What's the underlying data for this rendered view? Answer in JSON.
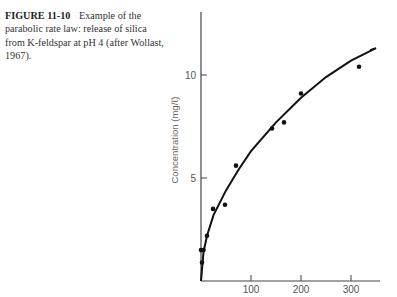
{
  "caption": {
    "figure_label": "FIGURE 11-10",
    "text": "Example of the parabolic rate law: release of silica from K-feldspar at pH 4 (after Wollast, 1967)."
  },
  "chart_data": {
    "type": "scatter",
    "title": "Example of the parabolic rate law: release of silica from K-feldspar at pH 4 (after Wollast, 1967).",
    "xlabel": "",
    "ylabel": "Concentration (mg/ℓ)",
    "xlim": [
      0,
      360
    ],
    "ylim": [
      0,
      13
    ],
    "xticks": [
      100,
      200,
      300
    ],
    "yticks": [
      5,
      10
    ],
    "grid": false,
    "legend": null,
    "series": [
      {
        "name": "Observed",
        "type": "scatter",
        "x": [
          2,
          0,
          5,
          12,
          24,
          48,
          70,
          142,
          166,
          200,
          316
        ],
        "y": [
          0.9,
          1.5,
          1.5,
          2.2,
          3.5,
          3.7,
          5.6,
          7.4,
          7.7,
          9.1,
          10.4
        ]
      },
      {
        "name": "Parabolic fit",
        "type": "line",
        "x": [
          0,
          5,
          12,
          25,
          50,
          75,
          100,
          150,
          200,
          250,
          300,
          350
        ],
        "y": [
          0,
          1.4,
          2.2,
          3.2,
          4.4,
          5.4,
          6.3,
          7.7,
          8.9,
          9.9,
          10.7,
          11.3
        ]
      }
    ]
  }
}
